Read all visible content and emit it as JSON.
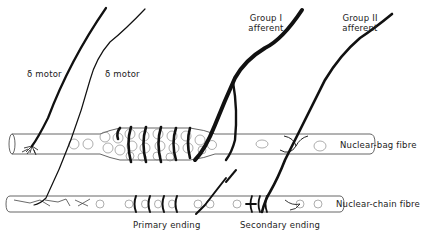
{
  "diagram": {
    "labels": {
      "gamma_motor_1": "δ motor",
      "gamma_motor_2": "δ motor",
      "group1_line1": "Group I",
      "group1_line2": "afferent",
      "group2_line1": "Group II",
      "group2_line2": "afferent",
      "nuclear_bag": "Nuclear-bag fibre",
      "nuclear_chain": "Nuclear-chain fibre",
      "primary_ending": "Primary ending",
      "secondary_ending": "Secondary ending"
    },
    "colors": {
      "ink": "#111111",
      "outline": "#555555",
      "background": "#ffffff"
    }
  }
}
